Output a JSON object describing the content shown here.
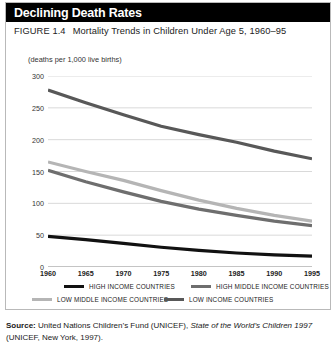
{
  "header": {
    "title": "Declining Death Rates"
  },
  "caption": {
    "figure_number": "FIGURE 1.4",
    "figure_title": "Mortality Trends in Children Under Age 5, 1960–95"
  },
  "source": {
    "label": "Source:",
    "text_before_italic": " United Nations Children’s Fund (UNICEF), ",
    "italic_text": "State of the World’s Children 1997",
    "text_after_italic": " (UNICEF, New York, 1997)."
  },
  "colors": {
    "title_bar": "#000000",
    "title_text": "#ffffff",
    "grid": "#c9c9c9",
    "frame": "#b9b9b9",
    "high_income": "#111111",
    "high_middle_income": "#6e6e6e",
    "low_middle_income": "#b5b5b5",
    "low_income": "#585858"
  },
  "chart_data": {
    "type": "line",
    "title": "Mortality Trends in Children Under Age 5, 1960–95",
    "subtitle": "Declining Death Rates",
    "xlabel": "",
    "ylabel": "(deaths per 1,000 live births)",
    "unit_note": "(deaths per 1,000 live births)",
    "x": [
      1960,
      1965,
      1970,
      1975,
      1980,
      1985,
      1990,
      1995
    ],
    "xticklabels": [
      "1960",
      "1965",
      "1970",
      "1975",
      "1980",
      "1985",
      "1990",
      "1995"
    ],
    "yticks": [
      0,
      50,
      100,
      150,
      200,
      250,
      300
    ],
    "yticklabels": [
      "0",
      "50",
      "100",
      "150",
      "200",
      "250",
      "300"
    ],
    "xlim": [
      1960,
      1995
    ],
    "ylim": [
      0,
      300
    ],
    "grid": "horizontal",
    "legend_position": "below-axis",
    "series": [
      {
        "name": "HIGH INCOME COUNTRIES",
        "color": "#111111",
        "values": [
          48,
          43,
          37,
          31,
          26,
          22,
          19,
          17
        ]
      },
      {
        "name": "HIGH MIDDLE INCOME COUNTRIES",
        "color": "#6e6e6e",
        "values": [
          152,
          134,
          118,
          103,
          91,
          81,
          72,
          65
        ]
      },
      {
        "name": "LOW MIDDLE INCOME COUNTRIES",
        "color": "#b5b5b5",
        "values": [
          165,
          150,
          136,
          120,
          105,
          92,
          81,
          72
        ]
      },
      {
        "name": "LOW INCOME COUNTRIES",
        "color": "#585858",
        "values": [
          278,
          258,
          239,
          221,
          208,
          196,
          182,
          170
        ]
      }
    ]
  }
}
